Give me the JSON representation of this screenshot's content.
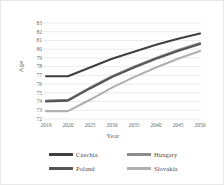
{
  "chart_data": {
    "type": "line",
    "title": "",
    "xlabel": "Year",
    "ylabel": "Age",
    "categories": [
      "2019",
      "2020",
      "2025",
      "2030",
      "2035",
      "2040",
      "2045",
      "2050"
    ],
    "x": [
      2019,
      2020,
      2025,
      2030,
      2035,
      2040,
      2045,
      2050
    ],
    "ylim": [
      72,
      83
    ],
    "yticks": [
      72,
      73,
      74,
      75,
      76,
      77,
      78,
      79,
      80,
      81,
      82,
      83
    ],
    "grid": "horizontal",
    "legend_position": "bottom",
    "series": [
      {
        "name": "Czechia",
        "color": "#404040",
        "values": [
          76.9,
          76.9,
          77.9,
          78.9,
          79.7,
          80.5,
          81.2,
          81.8
        ]
      },
      {
        "name": "Hungary",
        "color": "#8c8c8c",
        "values": [
          74.1,
          74.2,
          75.6,
          76.9,
          78.0,
          79.0,
          79.9,
          80.7
        ]
      },
      {
        "name": "Poland",
        "color": "#565656",
        "values": [
          74.0,
          74.1,
          75.5,
          76.8,
          77.9,
          78.9,
          79.8,
          80.6
        ]
      },
      {
        "name": "Slovakia",
        "color": "#b0b0b0",
        "values": [
          72.9,
          72.9,
          74.2,
          75.6,
          76.8,
          77.9,
          78.9,
          79.8
        ]
      }
    ],
    "plot_area": {
      "left": 45,
      "right": 199,
      "top": 22,
      "bottom": 118
    }
  }
}
